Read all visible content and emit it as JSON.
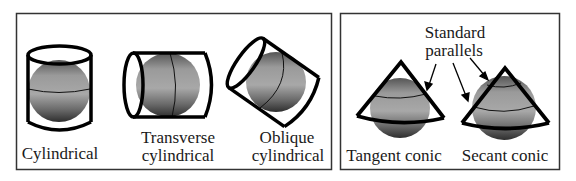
{
  "colors": {
    "frame": "#333333",
    "outline": "#000000",
    "globe_light": "#b8b8b8",
    "globe_mid": "#8c8c8c",
    "globe_dark": "#3a3a3a"
  },
  "panels": [
    {
      "id": "cylindrical-panel",
      "items": [
        {
          "id": "cylindrical",
          "label_lines": [
            "Cylindrical"
          ]
        },
        {
          "id": "transverse",
          "label_lines": [
            "Transverse",
            "cylindrical"
          ]
        },
        {
          "id": "oblique",
          "label_lines": [
            "Oblique",
            "cylindrical"
          ]
        }
      ]
    },
    {
      "id": "conic-panel",
      "annotation_lines": [
        "Standard",
        "parallels"
      ],
      "items": [
        {
          "id": "tangent",
          "label_lines": [
            "Tangent conic"
          ]
        },
        {
          "id": "secant",
          "label_lines": [
            "Secant conic"
          ]
        }
      ]
    }
  ]
}
